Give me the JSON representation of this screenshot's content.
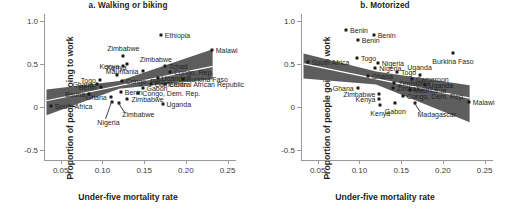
{
  "figure": {
    "x_axis_title": "Under-five mortality rate",
    "y_axis_title": "Proportion of people going to work"
  },
  "chart_data": [
    {
      "type": "scatter",
      "title": "a. Walking or biking",
      "xlabel": "Under-five mortality rate",
      "ylabel": "Proportion of people going to work",
      "xlim": [
        0.03,
        0.26
      ],
      "ylim": [
        -0.62,
        1.08
      ],
      "xticks": [
        0.05,
        0.1,
        0.15,
        0.2,
        0.25
      ],
      "xticklabels": [
        "0.05",
        "0.10",
        "0.15",
        "0.20",
        "0.25"
      ],
      "yticks": [
        1.0,
        0.5,
        0,
        -0.5
      ],
      "yticklabels": [
        "1.0",
        "0.5",
        "0",
        "-0.5"
      ],
      "grid": false,
      "legend": false,
      "trend": "positive",
      "trend_line": [
        [
          0.033,
          0.07
        ],
        [
          0.232,
          0.47
        ]
      ],
      "confidence_band": {
        "upper": [
          [
            0.033,
            0.2
          ],
          [
            0.12,
            0.3
          ],
          [
            0.232,
            0.67
          ]
        ],
        "lower": [
          [
            0.033,
            -0.1
          ],
          [
            0.12,
            0.21
          ],
          [
            0.232,
            0.32
          ]
        ],
        "color": "#5d5d5d"
      },
      "points": [
        {
          "label": "Ethiopia",
          "x": 0.17,
          "y": 0.83,
          "label_side": "right"
        },
        {
          "label": "Malawi",
          "x": 0.231,
          "y": 0.66,
          "label_side": "right"
        },
        {
          "label": "Zimbabwe",
          "x": 0.125,
          "y": 0.59,
          "label_side": "above"
        },
        {
          "label": "Zimbabwe",
          "x": 0.129,
          "y": 0.5,
          "label_side": "leader-right"
        },
        {
          "label": "Kenya",
          "x": 0.125,
          "y": 0.47,
          "label_side": "left"
        },
        {
          "label": "Tchad",
          "x": 0.175,
          "y": 0.475,
          "label_side": "right"
        },
        {
          "label": "Mauritania",
          "x": 0.148,
          "y": 0.42,
          "label_side": "left"
        },
        {
          "label": "Congo, Rep.",
          "x": 0.181,
          "y": 0.4,
          "label_side": "right"
        },
        {
          "label": "Kenya",
          "x": 0.117,
          "y": 0.375,
          "label_side": "above"
        },
        {
          "label": "Uganda",
          "x": 0.166,
          "y": 0.33,
          "label_side": "right"
        },
        {
          "label": "Burkina Faso",
          "x": 0.196,
          "y": 0.325,
          "label_side": "right"
        },
        {
          "label": "Togo",
          "x": 0.097,
          "y": 0.31,
          "label_side": "left"
        },
        {
          "label": "Congo, Rep.",
          "x": 0.123,
          "y": 0.305,
          "label_side": "right"
        },
        {
          "label": "Ghana",
          "x": 0.094,
          "y": 0.27,
          "label_side": "left"
        },
        {
          "label": "Cameroon",
          "x": 0.158,
          "y": 0.265,
          "label_side": "right"
        },
        {
          "label": "Central African Republic",
          "x": 0.175,
          "y": 0.262,
          "label_side": "right"
        },
        {
          "label": "Benin",
          "x": 0.098,
          "y": 0.225,
          "label_side": "left"
        },
        {
          "label": "Gabon",
          "x": 0.148,
          "y": 0.215,
          "label_side": "right"
        },
        {
          "label": "Benin",
          "x": 0.122,
          "y": 0.17,
          "label_side": "right"
        },
        {
          "label": "Congo, Dem. Rep.",
          "x": 0.143,
          "y": 0.16,
          "label_side": "right"
        },
        {
          "label": "Bsuna",
          "x": 0.084,
          "y": 0.15,
          "label_side": "left"
        },
        {
          "label": "Ghana",
          "x": 0.11,
          "y": 0.11,
          "label_side": "left"
        },
        {
          "label": "Zimbabwe",
          "x": 0.13,
          "y": 0.095,
          "label_side": "right"
        },
        {
          "label": "Uganda",
          "x": 0.172,
          "y": 0.03,
          "label_side": "right"
        },
        {
          "label": "Zimbabwe",
          "x": 0.12,
          "y": 0.045,
          "label_side": "leader-below"
        },
        {
          "label": "Nigeria",
          "x": 0.112,
          "y": 0.06,
          "label_side": "leader-below2"
        },
        {
          "label": "South Africa",
          "x": 0.038,
          "y": 0.005,
          "label_side": "right"
        }
      ]
    },
    {
      "type": "scatter",
      "title": "b. Motorized",
      "xlabel": "Under-five mortality rate",
      "ylabel": "Proportion of people going to work",
      "xlim": [
        0.03,
        0.26
      ],
      "ylim": [
        -0.62,
        1.08
      ],
      "xticks": [
        0.05,
        0.1,
        0.15,
        0.2,
        0.25
      ],
      "xticklabels": [
        "0.05",
        "0.10",
        "0.15",
        "0.20",
        "0.25"
      ],
      "yticks": [
        1.0,
        0.5,
        0,
        -0.5
      ],
      "yticklabels": [
        "1.0",
        "0.5",
        "0",
        "-0.5"
      ],
      "grid": false,
      "legend": false,
      "trend": "negative",
      "trend_line": [
        [
          0.033,
          0.5
        ],
        [
          0.232,
          0.1
        ]
      ],
      "confidence_band": {
        "upper": [
          [
            0.033,
            0.62
          ],
          [
            0.12,
            0.41
          ],
          [
            0.232,
            0.25
          ]
        ],
        "lower": [
          [
            0.033,
            0.33
          ],
          [
            0.12,
            0.26
          ],
          [
            0.232,
            -0.18
          ]
        ],
        "color": "#5d5d5d"
      },
      "points": [
        {
          "label": "Benin",
          "x": 0.084,
          "y": 0.89,
          "label_side": "right"
        },
        {
          "label": "Benin",
          "x": 0.117,
          "y": 0.84,
          "label_side": "right"
        },
        {
          "label": "Benin",
          "x": 0.098,
          "y": 0.78,
          "label_side": "right"
        },
        {
          "label": "Burkina Faso",
          "x": 0.212,
          "y": 0.625,
          "label_side": "below"
        },
        {
          "label": "Togo",
          "x": 0.097,
          "y": 0.57,
          "label_side": "right"
        },
        {
          "label": "South Africa",
          "x": 0.038,
          "y": 0.52,
          "label_side": "right"
        },
        {
          "label": "Nigeria",
          "x": 0.122,
          "y": 0.51,
          "label_side": "right"
        },
        {
          "label": "Nigeria",
          "x": 0.119,
          "y": 0.455,
          "label_side": "right"
        },
        {
          "label": "Togo",
          "x": 0.145,
          "y": 0.405,
          "label_side": "right"
        },
        {
          "label": "Uganda",
          "x": 0.172,
          "y": 0.365,
          "label_side": "above"
        },
        {
          "label": "Ghana",
          "x": 0.11,
          "y": 0.36,
          "label_side": "right"
        },
        {
          "label": "Cameroon",
          "x": 0.163,
          "y": 0.32,
          "label_side": "right"
        },
        {
          "label": "Zimbabwe",
          "x": 0.142,
          "y": 0.275,
          "label_side": "right"
        },
        {
          "label": "Uganda",
          "x": 0.178,
          "y": 0.255,
          "label_side": "right"
        },
        {
          "label": "Ghana",
          "x": 0.098,
          "y": 0.215,
          "label_side": "left"
        },
        {
          "label": "Zimbabwe",
          "x": 0.14,
          "y": 0.215,
          "label_side": "right"
        },
        {
          "label": "Mauritania",
          "x": 0.16,
          "y": 0.195,
          "label_side": "right"
        },
        {
          "label": "Zimbabwe",
          "x": 0.124,
          "y": 0.15,
          "label_side": "left"
        },
        {
          "label": "Congo, Dem. Rep.",
          "x": 0.152,
          "y": 0.12,
          "label_side": "right"
        },
        {
          "label": "Kenya",
          "x": 0.124,
          "y": 0.09,
          "label_side": "left"
        },
        {
          "label": "Kenya",
          "x": 0.125,
          "y": 0.02,
          "label_side": "below"
        },
        {
          "label": "Gabon",
          "x": 0.143,
          "y": 0.04,
          "label_side": "below"
        },
        {
          "label": "Madagascar",
          "x": 0.166,
          "y": 0.04,
          "label_side": "leader-below"
        },
        {
          "label": "Malawi",
          "x": 0.231,
          "y": 0.05,
          "label_side": "right"
        }
      ]
    }
  ]
}
